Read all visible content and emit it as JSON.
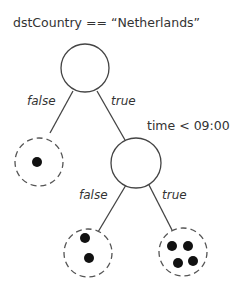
{
  "diagram": {
    "type": "decision-tree",
    "root": {
      "condition": "dstCountry == “Netherlands”",
      "false_label": "false",
      "true_label": "true"
    },
    "child": {
      "condition": "time < 09:00",
      "false_label": "false",
      "true_label": "true"
    },
    "leaves": [
      {
        "path": "root.false",
        "dot_count": 1
      },
      {
        "path": "child.false",
        "dot_count": 2
      },
      {
        "path": "child.true",
        "dot_count": 4
      }
    ],
    "colors": {
      "stroke": "#444444",
      "dot": "#111111",
      "text": "#333333"
    }
  }
}
